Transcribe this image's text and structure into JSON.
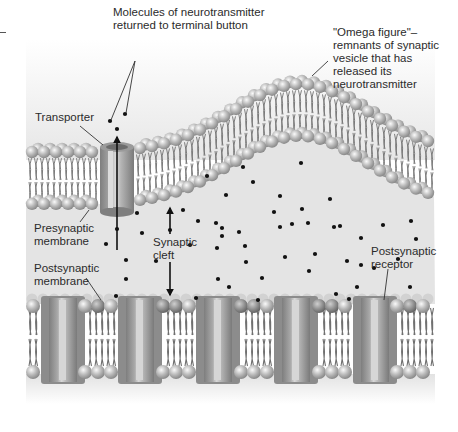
{
  "figure": {
    "colors": {
      "background": "#ffffff",
      "cleft_fill": "#e4e4e4",
      "lipid_head_light": "#e6e6e6",
      "lipid_head_mid": "#b9b9b9",
      "lipid_head_dark": "#8a8a8a",
      "lipid_tail": "#6f6f6f",
      "protein_light": "#c9c9c9",
      "protein_dark": "#8e8e8e",
      "molecule": "#111111",
      "leader_line": "#333333",
      "text": "#2b2b2b"
    }
  },
  "labels": {
    "molecules_returned": "Molecules of neurotransmitter\nreturned to terminal button",
    "omega_figure": "\"Omega figure\"–\nremnants of synaptic\nvesicle that has\nreleased its\nneurotransmitter",
    "transporter": "Transporter",
    "presynaptic_membrane": "Presynaptic\nmembrane",
    "synaptic_cleft": "Synaptic\ncleft",
    "postsynaptic_membrane": "Postsynaptic\nmembrane",
    "postsynaptic_receptor": "Postsynaptic\nreceptor"
  },
  "label_positions": {
    "molecules_returned": [
      113,
      6
    ],
    "omega_figure": [
      333,
      26
    ],
    "transporter": [
      35,
      111
    ],
    "presynaptic_membrane": [
      34,
      222
    ],
    "synaptic_cleft": [
      153,
      236
    ],
    "postsynaptic_membrane": [
      34,
      262
    ],
    "postsynaptic_receptor": [
      371,
      245
    ]
  },
  "leader_lines": [
    {
      "name": "molecules-leader-1",
      "from": [
        135,
        61
      ],
      "to": [
        111,
        120
      ]
    },
    {
      "name": "molecules-leader-2",
      "from": [
        135,
        61
      ],
      "to": [
        126,
        113
      ]
    },
    {
      "name": "omega-leader",
      "from": [
        328,
        61
      ],
      "to": [
        312,
        76
      ]
    },
    {
      "name": "transporter-leader",
      "from": [
        80,
        126
      ],
      "to": [
        103,
        145
      ]
    },
    {
      "name": "presynaptic-leader",
      "from": [
        80,
        222
      ],
      "to": [
        89,
        210
      ]
    },
    {
      "name": "postsynaptic-membrane-leader",
      "from": [
        86,
        278
      ],
      "to": [
        101,
        300
      ]
    },
    {
      "name": "receptor-leader",
      "from": [
        388,
        269
      ],
      "to": [
        384,
        300
      ]
    }
  ],
  "arrows": [
    {
      "name": "transporter-uptake-arrow",
      "from": [
        117,
        250
      ],
      "to": [
        117,
        137
      ]
    },
    {
      "name": "cleft-arrow-up",
      "from": [
        170,
        234
      ],
      "to": [
        170,
        208
      ]
    },
    {
      "name": "cleft-arrow-down",
      "from": [
        170,
        262
      ],
      "to": [
        170,
        295
      ]
    }
  ],
  "presynaptic_membrane": {
    "left_x": 26,
    "right_x": 435,
    "flat_y": 152,
    "thickness": 58,
    "omega": {
      "center_x": 300,
      "peak_rise": 68,
      "half_width": 110
    }
  },
  "transporter": {
    "x": 117,
    "top": 147,
    "bottom": 212,
    "width": 34
  },
  "postsynaptic_membrane": {
    "left_x": 26,
    "right_x": 435,
    "top_y": 298,
    "bottom_y": 378,
    "receptors_x": [
      63,
      140,
      218,
      296,
      375
    ],
    "receptor_width": 34
  },
  "neurotransmitter_molecules": [
    [
      110,
      121
    ],
    [
      125,
      114
    ],
    [
      117,
      129
    ],
    [
      137,
      213
    ],
    [
      183,
      210
    ],
    [
      117,
      229
    ],
    [
      142,
      233
    ],
    [
      106,
      244
    ],
    [
      126,
      260
    ],
    [
      126,
      279
    ],
    [
      116,
      296
    ],
    [
      156,
      261
    ],
    [
      198,
      221
    ],
    [
      216,
      223
    ],
    [
      217,
      248
    ],
    [
      218,
      279
    ],
    [
      196,
      298
    ],
    [
      222,
      228
    ],
    [
      207,
      176
    ],
    [
      226,
      195
    ],
    [
      253,
      182
    ],
    [
      280,
      196
    ],
    [
      243,
      167
    ],
    [
      301,
      163
    ],
    [
      274,
      212
    ],
    [
      330,
      199
    ],
    [
      302,
      209
    ],
    [
      246,
      262
    ],
    [
      222,
      236
    ],
    [
      292,
      224
    ],
    [
      340,
      226
    ],
    [
      309,
      271
    ],
    [
      361,
      238
    ],
    [
      374,
      268
    ],
    [
      229,
      287
    ],
    [
      262,
      278
    ],
    [
      239,
      232
    ],
    [
      285,
      257
    ],
    [
      315,
      254
    ],
    [
      347,
      261
    ],
    [
      336,
      294
    ],
    [
      357,
      287
    ],
    [
      383,
      225
    ],
    [
      398,
      259
    ],
    [
      411,
      221
    ],
    [
      410,
      287
    ],
    [
      416,
      239
    ],
    [
      258,
      300
    ],
    [
      349,
      299
    ],
    [
      308,
      223
    ],
    [
      334,
      227
    ],
    [
      245,
      246
    ],
    [
      190,
      245
    ],
    [
      170,
      230
    ],
    [
      280,
      227
    ],
    [
      361,
      265
    ]
  ]
}
